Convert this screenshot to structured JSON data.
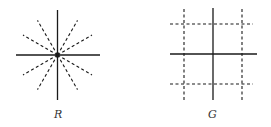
{
  "figures": [
    {
      "id": "R",
      "label": "R",
      "description": "Solid horizontal and vertical axes crossing at a central dot, with 8 dashed rays radiating from the center at 30-degree increments (excluding the axes)."
    },
    {
      "id": "G",
      "label": "G",
      "description": "Solid horizontal and vertical axes with two dashed vertical lines and two dashed horizontal lines forming a grid."
    }
  ],
  "colors": {
    "line": "#1a1a1a",
    "background": "#ffffff"
  }
}
